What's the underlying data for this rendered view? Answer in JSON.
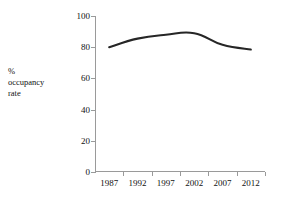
{
  "chart_data": {
    "type": "line",
    "title": "",
    "xlabel": "",
    "ylabel": "% occupancy rate",
    "ylabel_lines": [
      "%",
      "occupancy",
      "rate"
    ],
    "categories": [
      "1987",
      "1992",
      "1997",
      "2002",
      "2007",
      "2012"
    ],
    "series": [
      {
        "name": "% occupancy rate",
        "values": [
          80,
          85.5,
          88,
          89,
          81.5,
          78.5
        ],
        "color": "#262626"
      }
    ],
    "ylim": [
      0,
      100
    ],
    "yticks": [
      0,
      20,
      40,
      60,
      80,
      100
    ],
    "ytick_labels": [
      "0",
      "20",
      "40",
      "60",
      "80",
      "100"
    ],
    "grid": false,
    "legend": false,
    "legend_position": "none",
    "axis_color": "#9a9a9a",
    "background_color": "#ffffff",
    "text_color": "#111111"
  }
}
